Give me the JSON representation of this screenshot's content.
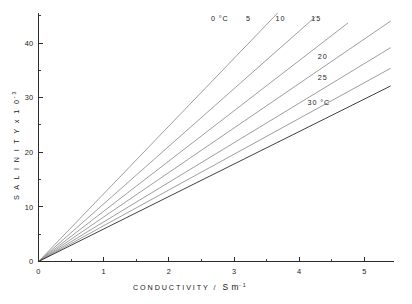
{
  "figure": {
    "background_color": "#ffffff",
    "line_color": "#8c8c8c",
    "axis_color": "#2b2b2b"
  },
  "axes": {
    "x": {
      "title_text": "CONDUCTIVITY /",
      "unit_symbol": "S m",
      "unit_exponent": "-1",
      "ticklabels": [
        "0",
        "1",
        "2",
        "3",
        "4",
        "5"
      ],
      "tickvalues": [
        0,
        1,
        2,
        3,
        4,
        5
      ],
      "minor_tickvalues": [
        0.5,
        1.5,
        2.5,
        3.5,
        4.5
      ],
      "range": [
        0,
        5.45
      ]
    },
    "y": {
      "title_text": "S A L I N I T Y   x   1 0",
      "title_plain": "SALINITY x 10",
      "title_exponent": "-3",
      "ticklabels": [
        "0",
        "10",
        "20",
        "30",
        "40"
      ],
      "tickvalues": [
        0,
        10,
        20,
        30,
        40
      ],
      "minor_tickvalues": [
        5,
        15,
        25,
        35,
        45
      ],
      "range": [
        0,
        45.5
      ]
    }
  },
  "chart_data": {
    "type": "line",
    "title": "",
    "xlabel": "CONDUCTIVITY / S m-1",
    "ylabel": "SALINITY x 10-3",
    "xlim": [
      0,
      5.45
    ],
    "ylim": [
      0,
      45.5
    ],
    "grid": false,
    "legend": "inline-curve-labels",
    "x": [
      0,
      5.45
    ],
    "series": [
      {
        "name": "0 °C",
        "label": "0 °C",
        "temperature_c": 0,
        "slope": 12.4,
        "x_end": 3.75,
        "points": [
          [
            0,
            0
          ],
          [
            3.75,
            46.5
          ]
        ],
        "label_x": 2.78,
        "label_y": 44.1
      },
      {
        "name": "5",
        "label": "5",
        "temperature_c": 5,
        "slope": 10.55,
        "x_end": 4.25,
        "points": [
          [
            0,
            0
          ],
          [
            4.25,
            44.8
          ]
        ],
        "label_x": 3.22,
        "label_y": 44.1
      },
      {
        "name": "10",
        "label": "10",
        "temperature_c": 10,
        "slope": 9.2,
        "x_end": 4.75,
        "points": [
          [
            0,
            0
          ],
          [
            4.75,
            43.7
          ]
        ],
        "label_x": 3.71,
        "label_y": 44.1
      },
      {
        "name": "15",
        "label": "15",
        "temperature_c": 15,
        "slope": 8.15,
        "x_end": 5.4,
        "points": [
          [
            0,
            0
          ],
          [
            5.4,
            44.0
          ]
        ],
        "label_x": 4.26,
        "label_y": 44.1
      },
      {
        "name": "20",
        "label": "20",
        "temperature_c": 20,
        "slope": 7.25,
        "x_end": 5.4,
        "points": [
          [
            0,
            0
          ],
          [
            5.4,
            39.2
          ]
        ],
        "label_x": 4.36,
        "label_y": 37.1
      },
      {
        "name": "25",
        "label": "25",
        "temperature_c": 25,
        "slope": 6.55,
        "x_end": 5.4,
        "points": [
          [
            0,
            0
          ],
          [
            5.4,
            35.4
          ]
        ],
        "label_x": 4.36,
        "label_y": 33.2
      },
      {
        "name": "30 °C",
        "label": "30 °C",
        "temperature_c": 30,
        "slope": 5.95,
        "x_end": 5.4,
        "points": [
          [
            0,
            0
          ],
          [
            5.4,
            32.1
          ]
        ],
        "label_x": 4.3,
        "label_y": 28.6
      }
    ]
  }
}
